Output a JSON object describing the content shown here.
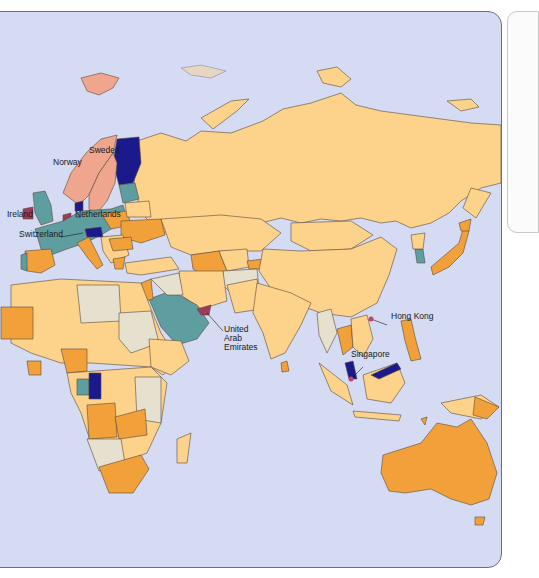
{
  "map": {
    "colors": {
      "ocean": "#d4dbf2",
      "category_dark_blue": "#1a1a8c",
      "category_teal": "#5e9ea0",
      "category_pink": "#efa58e",
      "category_crimson": "#a03a5c",
      "category_orange": "#f2a03a",
      "category_light_orange": "#fdd28a",
      "category_gray": "#e6e0cf",
      "border": "#5a4a3a"
    },
    "labels": [
      {
        "id": "norway",
        "text": "Norway"
      },
      {
        "id": "sweden",
        "text": "Sweden"
      },
      {
        "id": "ireland",
        "text": "Ireland"
      },
      {
        "id": "netherlands",
        "text": "Netherlands"
      },
      {
        "id": "switzerland",
        "text": "Switzerland"
      },
      {
        "id": "uae_1",
        "text": "United"
      },
      {
        "id": "uae_2",
        "text": "Arab"
      },
      {
        "id": "uae_3",
        "text": "Emirates"
      },
      {
        "id": "hong_kong",
        "text": "Hong Kong"
      },
      {
        "id": "singapore",
        "text": "Singapore"
      }
    ]
  }
}
